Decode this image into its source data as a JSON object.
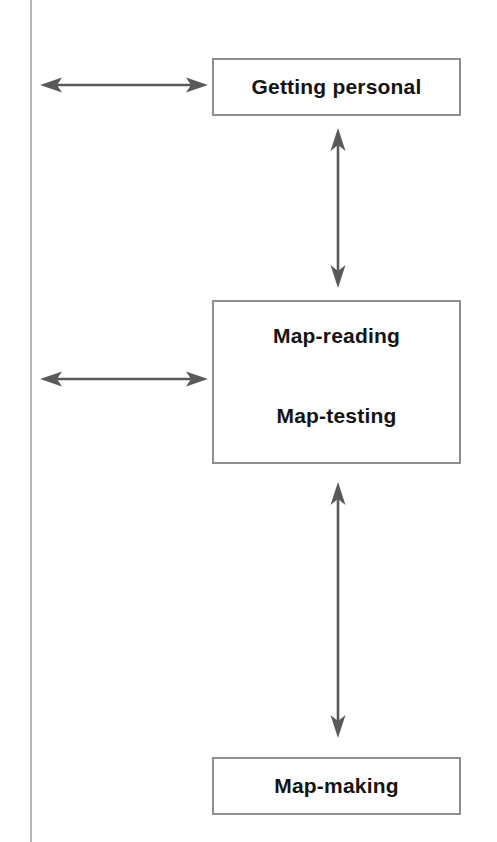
{
  "diagram": {
    "background_color": "#ffffff",
    "box_border_color": "#8e8e8e",
    "arrow_color": "#595959",
    "text_color": "#141414",
    "boxes": [
      {
        "id": "getting-personal",
        "labels": [
          "Getting personal"
        ]
      },
      {
        "id": "map-reading-testing",
        "labels": [
          "Map-reading",
          "Map-testing"
        ]
      },
      {
        "id": "map-making",
        "labels": [
          "Map-making"
        ]
      }
    ],
    "arrows": [
      {
        "id": "left-top",
        "orientation": "horizontal",
        "heads": "double",
        "connects": "off-page-left <-> getting-personal"
      },
      {
        "id": "left-middle",
        "orientation": "horizontal",
        "heads": "double",
        "connects": "off-page-left <-> map-reading-testing"
      },
      {
        "id": "vertical-top",
        "orientation": "vertical",
        "heads": "double",
        "connects": "getting-personal <-> map-reading-testing"
      },
      {
        "id": "vertical-bottom",
        "orientation": "vertical",
        "heads": "double",
        "connects": "map-reading-testing <-> map-making"
      }
    ],
    "edge_rule": {
      "id": "scan-edge",
      "orientation": "vertical",
      "color": "#9a9a9a"
    }
  }
}
